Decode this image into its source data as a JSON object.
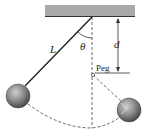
{
  "diagram": {
    "labels": {
      "length": "L",
      "angle": "θ",
      "distance": "d",
      "peg": "Peg"
    },
    "colors": {
      "ceiling": "#a9a9a9",
      "string": "#222222",
      "ball": "#7a7a7a",
      "dashed": "#444444"
    }
  }
}
